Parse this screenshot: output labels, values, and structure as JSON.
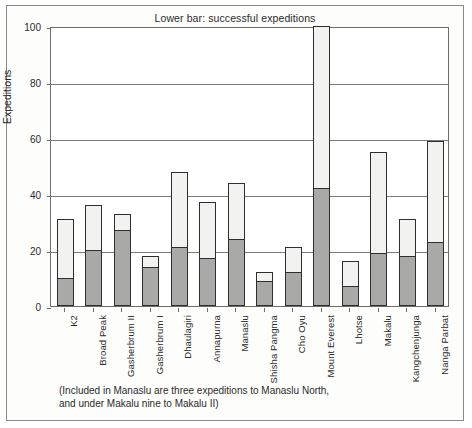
{
  "chart_data": {
    "type": "bar",
    "title": "Lower bar: successful expeditions",
    "xlabel": "",
    "ylabel": "Expeditions",
    "ylim": [
      0,
      100
    ],
    "yticks": [
      0,
      20,
      40,
      60,
      80,
      100
    ],
    "grid": true,
    "legend": "none",
    "stacked": true,
    "categories": [
      "K2",
      "Broad Peak",
      "Gasherbrum II",
      "Gasherbrum I",
      "Dhaulagiri",
      "Annapurna",
      "Manaslu",
      "Shisha Pangma",
      "Cho Oyu",
      "Mount Everest",
      "Lhotse",
      "Makalu",
      "Kangchenjunga",
      "Nanga Parbat"
    ],
    "series": [
      {
        "name": "Total expeditions",
        "values": [
          31,
          36,
          33,
          18,
          48,
          37,
          44,
          12,
          21,
          100,
          16,
          55,
          31,
          59
        ]
      },
      {
        "name": "Successful expeditions",
        "values": [
          10,
          20,
          27,
          14,
          21,
          17,
          24,
          9,
          12,
          42,
          7,
          19,
          18,
          23
        ]
      }
    ],
    "annotation": "(Included in Manaslu are three expeditions to Manaslu North, and under Makalu nine to Makalu II)",
    "annotation_lines": [
      "(Included in Manaslu are three expeditions to Manaslu North,",
      "and under Makalu nine to Makalu II)"
    ]
  },
  "colors": {
    "total_bar_fill": "#f2f2f0",
    "success_bar_fill": "#a9a9a7",
    "bar_outline": "#2e2e2e",
    "grid": "#7a7a7a",
    "axis": "#6d6d6d",
    "text": "#2b2b2b",
    "frame": "#8a8a8a"
  }
}
